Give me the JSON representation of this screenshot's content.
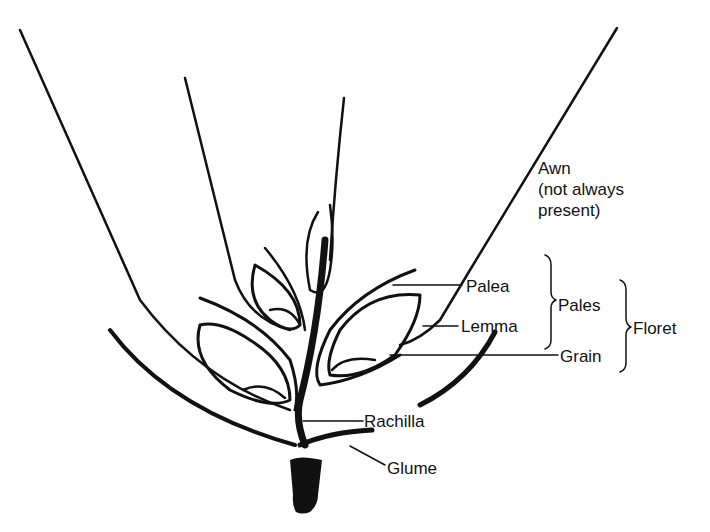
{
  "diagram": {
    "labels": {
      "awn": {
        "line1": "Awn",
        "line2": "(not always",
        "line3": "present)"
      },
      "palea": "Palea",
      "lemma": "Lemma",
      "pales": "Pales",
      "grain": "Grain",
      "floret": "Floret",
      "rachilla": "Rachilla",
      "glume": "Glume"
    },
    "colors": {
      "ink": "#111111",
      "background": "#ffffff"
    }
  }
}
